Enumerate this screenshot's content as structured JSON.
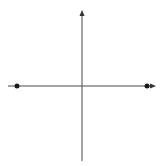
{
  "diagram": {
    "type": "coordinate-axes",
    "axis_color": "#4a4a4a",
    "point_color": "#1a1a1a",
    "horizontal_axis": {
      "x1": 8,
      "x2": 156,
      "y": 86,
      "arrow": "right"
    },
    "vertical_axis": {
      "x": 82,
      "y1": 11,
      "y2": 161,
      "arrow": "up"
    },
    "points": [
      {
        "label": "left-point",
        "x": 17,
        "y": 86
      },
      {
        "label": "right-point",
        "x": 147,
        "y": 86
      }
    ]
  }
}
